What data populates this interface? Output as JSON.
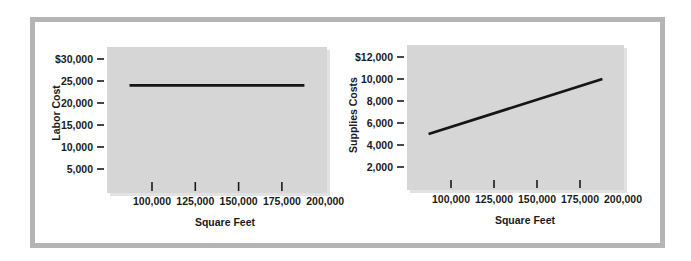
{
  "colors": {
    "frame": "#b5b5b5",
    "plot_background": "#d6d6d6",
    "line": "#151515",
    "text": "#1a1a1a"
  },
  "chart_data": [
    {
      "type": "line",
      "title": "",
      "xlabel": "Square Feet",
      "ylabel": "Labor Cost",
      "x_ticks": [
        "100,000",
        "125,000",
        "150,000",
        "175,000",
        "200,000"
      ],
      "x_tick_values": [
        100000,
        125000,
        150000,
        175000,
        200000
      ],
      "y_ticks": [
        "$30,000",
        "25,000",
        "20,000",
        "15,000",
        "10,000",
        "5,000"
      ],
      "y_tick_values": [
        30000,
        25000,
        20000,
        15000,
        10000,
        5000
      ],
      "xlim": [
        80000,
        210000
      ],
      "ylim": [
        0,
        32500
      ],
      "grid": false,
      "legend": null,
      "series": [
        {
          "name": "Labor Cost",
          "x": [
            87000,
            188000
          ],
          "y": [
            24000,
            24000
          ]
        }
      ]
    },
    {
      "type": "line",
      "title": "",
      "xlabel": "Square Feet",
      "ylabel": "Supplies Costs",
      "x_ticks": [
        "100,000",
        "125,000",
        "150,000",
        "175,000",
        "200,000"
      ],
      "x_tick_values": [
        100000,
        125000,
        150000,
        175000,
        200000
      ],
      "y_ticks": [
        "$12,000",
        "10,000",
        "8,000",
        "6,000",
        "4,000",
        "2,000"
      ],
      "y_tick_values": [
        12000,
        10000,
        8000,
        6000,
        4000,
        2000
      ],
      "xlim": [
        80000,
        210000
      ],
      "ylim": [
        0,
        13000
      ],
      "grid": false,
      "legend": null,
      "series": [
        {
          "name": "Supplies Costs",
          "x": [
            87000,
            188000
          ],
          "y": [
            5000,
            10000
          ]
        }
      ]
    }
  ]
}
